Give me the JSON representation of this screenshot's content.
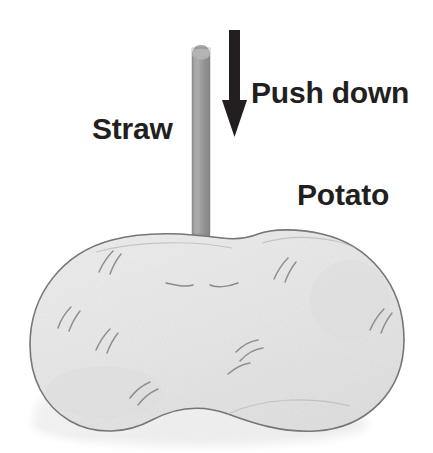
{
  "figure": {
    "type": "hand-drawn science diagram",
    "background_color": "#ffffff"
  },
  "labels": {
    "push_down": "Push down",
    "straw": "Straw",
    "potato": "Potato"
  },
  "objects": {
    "arrow": {
      "name": "push-down-arrow",
      "direction": "down",
      "color": "#231f20",
      "shaft_top_y": 30,
      "tip_y": 137
    },
    "straw": {
      "name": "straw",
      "color": "#9a9a9a",
      "outline_color": "#7d7d7d",
      "top_y": 48,
      "bottom_y": 286,
      "left_x": 192,
      "right_x": 210
    },
    "potato": {
      "name": "potato",
      "fill_color": "#e8e8e8",
      "outline_color": "#6e6e6e",
      "shadow_color": "#efefef",
      "eyes_count": 8,
      "left_x": 30,
      "right_x": 404,
      "top_y": 231,
      "bottom_y": 433
    }
  }
}
